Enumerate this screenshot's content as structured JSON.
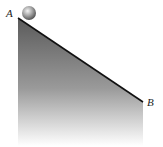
{
  "diagram": {
    "type": "inclined-plane",
    "labels": {
      "top_point": "A",
      "bottom_point": "B"
    },
    "colors": {
      "incline_top": "#5a5a5a",
      "incline_bottom": "#ffffff",
      "edge": "#111111"
    },
    "objects": [
      {
        "name": "ball",
        "position": "A"
      }
    ]
  }
}
